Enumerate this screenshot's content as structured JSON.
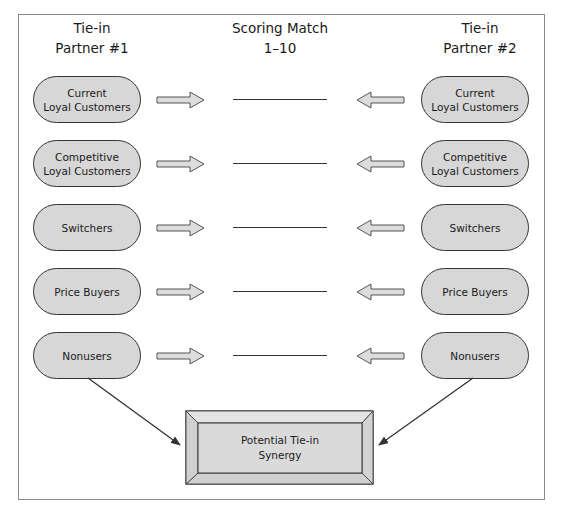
{
  "headers": {
    "left": "Tie-in\nPartner #1",
    "center": "Scoring Match\n1–10",
    "right": "Tie-in\nPartner #2"
  },
  "left_segments": [
    {
      "label": "Current\nLoyal Customers"
    },
    {
      "label": "Competitive\nLoyal Customers"
    },
    {
      "label": "Switchers"
    },
    {
      "label": "Price Buyers"
    },
    {
      "label": "Nonusers"
    }
  ],
  "right_segments": [
    {
      "label": "Current\nLoyal Customers"
    },
    {
      "label": "Competitive\nLoyal Customers"
    },
    {
      "label": "Switchers"
    },
    {
      "label": "Price Buyers"
    },
    {
      "label": "Nonusers"
    }
  ],
  "score_blanks": [
    "",
    "",
    "",
    "",
    ""
  ],
  "result": {
    "label": "Potential Tie-in\nSynergy"
  },
  "colors": {
    "pill_fill": "#d7d7d7",
    "arrow_fill": "#dcdcdc",
    "bevel_fill": "#dadada",
    "stroke": "#333333"
  }
}
